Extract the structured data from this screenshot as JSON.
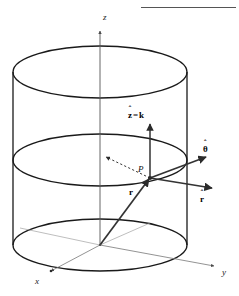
{
  "figure": {
    "background_color": "#ffffff",
    "stroke_color": "#1a1a1a",
    "thin_stroke_color": "#555555",
    "width": 239,
    "height": 296
  },
  "top_rule": {
    "name": "page-rule",
    "x": 141,
    "y": 7,
    "width": 95,
    "height": 1,
    "color": "#555555"
  },
  "axes": [
    {
      "id": "z",
      "label": "z",
      "label_x": 103,
      "label_y": 13,
      "style": "italic"
    },
    {
      "id": "x",
      "label": "x",
      "label_x": 35,
      "label_y": 277,
      "style": "italic"
    },
    {
      "id": "y",
      "label": "y",
      "label_x": 222,
      "label_y": 268,
      "style": "italic"
    }
  ],
  "point": {
    "id": "P",
    "label": "P",
    "label_x": 138,
    "label_y": 165,
    "x": 150,
    "y": 178
  },
  "origin": {
    "x": 100,
    "y": 245
  },
  "vectors": [
    {
      "id": "r-position",
      "label": "r",
      "label_html": "r",
      "kind": "bold-vector",
      "label_x": 129,
      "label_y": 188,
      "from": [
        100,
        245
      ],
      "to": [
        150,
        178
      ],
      "color": "#333333"
    },
    {
      "id": "z-hat",
      "label": "ẑ = k",
      "base": "z",
      "second": "k",
      "equals": "=",
      "kind": "unit-vector",
      "label_x": 128,
      "label_y": 111,
      "from": [
        150,
        178
      ],
      "to": [
        150,
        126
      ],
      "color": "#333333"
    },
    {
      "id": "theta-hat",
      "label": "θ̂",
      "base": "θ",
      "kind": "unit-vector",
      "label_x": 203,
      "label_y": 145,
      "from": [
        150,
        178
      ],
      "to": [
        205,
        158
      ],
      "color": "#333333"
    },
    {
      "id": "r-hat",
      "label": "r̂",
      "base": "r",
      "kind": "unit-vector",
      "label_x": 200,
      "label_y": 195,
      "from": [
        150,
        178
      ],
      "to": [
        210,
        192
      ],
      "color": "#333333"
    },
    {
      "id": "radial-dashed",
      "label": "",
      "kind": "dashed-radius",
      "from": [
        150,
        178
      ],
      "to": [
        104,
        156
      ],
      "color": "#333333"
    }
  ],
  "cylinder": {
    "center_x": 100,
    "radius_x": 87,
    "radius_y": 26,
    "top_ellipse_cy": 72,
    "middle_ellipse_cy": 160,
    "bottom_ellipse_cy": 245,
    "left_edge_x": 13,
    "right_edge_x": 187
  },
  "glyphs": {
    "hat": "ˆ",
    "theta": "θ",
    "equals": "="
  }
}
